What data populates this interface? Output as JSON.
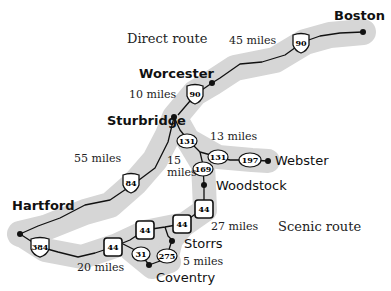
{
  "map": {
    "route_labels": {
      "direct": "Direct route",
      "scenic": "Scenic route"
    },
    "cities": [
      {
        "name": "Boston",
        "x": 363,
        "y": 32
      },
      {
        "name": "Worcester",
        "x": 212,
        "y": 83
      },
      {
        "name": "Sturbridge",
        "x": 172,
        "y": 117
      },
      {
        "name": "Webster",
        "x": 268,
        "y": 161
      },
      {
        "name": "Woodstock",
        "x": 204,
        "y": 185
      },
      {
        "name": "Hartford",
        "x": 20,
        "y": 234
      },
      {
        "name": "Storrs",
        "x": 172,
        "y": 240
      },
      {
        "name": "Coventry",
        "x": 149,
        "y": 265
      }
    ],
    "distances": {
      "boston_worcester": "45 miles",
      "worcester_sturbridge": "10 miles",
      "sturbridge_hartford": "55 miles",
      "sturbridge_webster": "13 miles",
      "sturbridge_woodstock": "15 miles",
      "woodstock_storrs": "27 miles",
      "storrs_coventry": "5 miles",
      "coventry_hartford": "20 miles"
    },
    "route_shields": [
      {
        "route": "90",
        "type": "interstate",
        "x": 301,
        "y": 43
      },
      {
        "route": "90",
        "type": "interstate",
        "x": 195,
        "y": 94
      },
      {
        "route": "84",
        "type": "interstate",
        "x": 131,
        "y": 183
      },
      {
        "route": "384",
        "type": "interstate",
        "x": 40,
        "y": 247
      },
      {
        "route": "131",
        "type": "state",
        "x": 187,
        "y": 141
      },
      {
        "route": "131",
        "type": "state",
        "x": 218,
        "y": 157
      },
      {
        "route": "197",
        "type": "state",
        "x": 250,
        "y": 160
      },
      {
        "route": "169",
        "type": "state",
        "x": 203,
        "y": 169
      },
      {
        "route": "44",
        "type": "us",
        "x": 204,
        "y": 209
      },
      {
        "route": "44",
        "type": "us",
        "x": 182,
        "y": 224
      },
      {
        "route": "44",
        "type": "us",
        "x": 145,
        "y": 230
      },
      {
        "route": "44",
        "type": "us",
        "x": 113,
        "y": 247
      },
      {
        "route": "31",
        "type": "state",
        "x": 141,
        "y": 254
      },
      {
        "route": "275",
        "type": "state",
        "x": 167,
        "y": 256
      }
    ]
  }
}
